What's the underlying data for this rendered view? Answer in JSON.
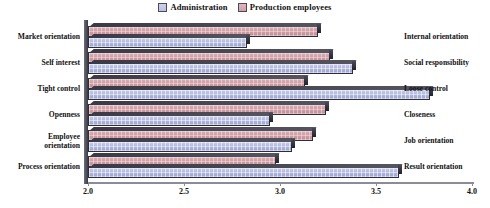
{
  "legend": {
    "items": [
      {
        "label": "Administration",
        "color": "#b9c0e0",
        "icon": "legend-swatch"
      },
      {
        "label": "Production employees",
        "color": "#cfa0a6",
        "icon": "legend-swatch"
      }
    ]
  },
  "axis": {
    "ticks": [
      "2.0",
      "2.5",
      "3.0",
      "3.5",
      "4.0"
    ],
    "min": 2.0,
    "max": 4.0
  },
  "rows": [
    {
      "left": "Market orientation",
      "right": "Internal orientation"
    },
    {
      "left": "Self interest",
      "right": "Social responsibility"
    },
    {
      "left": "Tight control",
      "right": "Loose control"
    },
    {
      "left": "Openness",
      "right": "Closeness"
    },
    {
      "left": "Employee\norientation",
      "right": "Job orientation"
    },
    {
      "left": "Process orientation",
      "right": "Result orientation"
    }
  ],
  "chart_data": {
    "type": "bar",
    "orientation": "horizontal",
    "title": "",
    "xlabel": "",
    "ylabel": "",
    "xlim": [
      2.0,
      4.0
    ],
    "xticks": [
      2.0,
      2.5,
      3.0,
      3.5,
      4.0
    ],
    "grid": false,
    "legend_position": "top-center",
    "categories": [
      "Market orientation / Internal orientation",
      "Self interest / Social responsibility",
      "Tight control / Loose control",
      "Openness / Closeness",
      "Employee orientation / Job orientation",
      "Process orientation / Result orientation"
    ],
    "series": [
      {
        "name": "Administration",
        "color": "#b9c0e0",
        "values": [
          2.83,
          3.38,
          3.78,
          2.95,
          3.06,
          3.62
        ]
      },
      {
        "name": "Production employees",
        "color": "#cfa0a6",
        "values": [
          3.2,
          3.26,
          3.13,
          3.24,
          3.17,
          2.98
        ]
      }
    ]
  }
}
